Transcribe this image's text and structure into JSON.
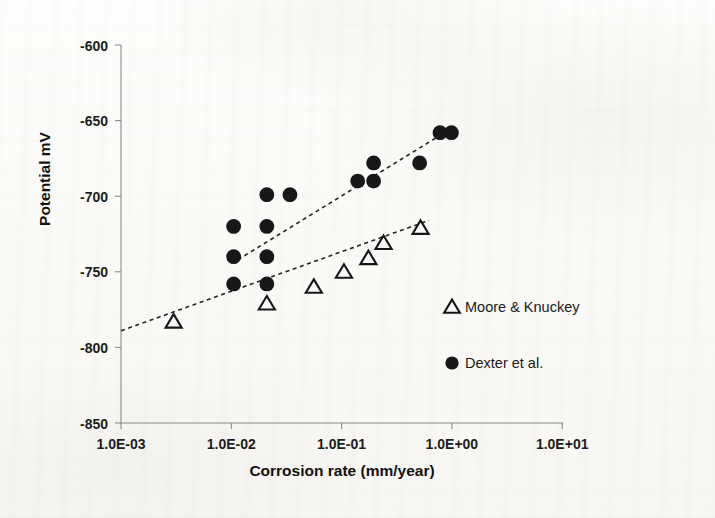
{
  "chart_data": {
    "type": "scatter",
    "title": "",
    "xlabel": "Corrosion rate (mm/year)",
    "ylabel": "Potential mV",
    "xscale": "log",
    "xlim": [
      0.001,
      10
    ],
    "ylim": [
      -850,
      -600
    ],
    "grid": false,
    "legend_position": "inside-lower-right",
    "x_ticks": [
      {
        "value": 0.001,
        "label": "1.0E-03"
      },
      {
        "value": 0.01,
        "label": "1.0E-02"
      },
      {
        "value": 0.1,
        "label": "1.0E-01"
      },
      {
        "value": 1,
        "label": "1.0E+00"
      },
      {
        "value": 10,
        "label": "1.0E+01"
      }
    ],
    "y_ticks": [
      {
        "value": -600,
        "label": "-600"
      },
      {
        "value": -650,
        "label": "-650"
      },
      {
        "value": -700,
        "label": "-700"
      },
      {
        "value": -750,
        "label": "-750"
      },
      {
        "value": -800,
        "label": "-800"
      },
      {
        "value": -850,
        "label": "-850"
      }
    ],
    "series": [
      {
        "name": "Moore & Knuckey",
        "marker": "open-triangle",
        "color": "#17171a",
        "points": [
          {
            "x": 0.003,
            "y": -783
          },
          {
            "x": 0.021,
            "y": -771
          },
          {
            "x": 0.056,
            "y": -760
          },
          {
            "x": 0.105,
            "y": -750
          },
          {
            "x": 0.175,
            "y": -741
          },
          {
            "x": 0.24,
            "y": -731
          },
          {
            "x": 0.52,
            "y": -721
          }
        ],
        "trendline": {
          "x1": 0.001,
          "y1": -789,
          "x2": 0.62,
          "y2": -716
        }
      },
      {
        "name": "Dexter et al.",
        "marker": "filled-circle",
        "color": "#18181a",
        "points": [
          {
            "x": 0.0105,
            "y": -720
          },
          {
            "x": 0.0105,
            "y": -740
          },
          {
            "x": 0.0105,
            "y": -758
          },
          {
            "x": 0.021,
            "y": -699
          },
          {
            "x": 0.021,
            "y": -720
          },
          {
            "x": 0.021,
            "y": -740
          },
          {
            "x": 0.021,
            "y": -758
          },
          {
            "x": 0.034,
            "y": -699
          },
          {
            "x": 0.14,
            "y": -690
          },
          {
            "x": 0.195,
            "y": -678
          },
          {
            "x": 0.195,
            "y": -690
          },
          {
            "x": 0.51,
            "y": -678
          },
          {
            "x": 0.78,
            "y": -658
          },
          {
            "x": 0.99,
            "y": -658
          }
        ],
        "trendline": {
          "x1": 0.0115,
          "y1": -742,
          "x2": 1.05,
          "y2": -654
        }
      }
    ]
  },
  "legend": {
    "entries": [
      {
        "label": "Moore & Knuckey",
        "marker": "open-triangle"
      },
      {
        "label": "Dexter et al.",
        "marker": "filled-circle"
      }
    ]
  }
}
